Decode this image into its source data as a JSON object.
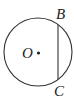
{
  "diagram": {
    "type": "geometry",
    "circle": {
      "cx": 38,
      "cy": 52,
      "r": 34,
      "stroke": "#333333"
    },
    "chord": {
      "x1": 58,
      "y1": 24.5,
      "x2": 58,
      "y2": 79.5,
      "stroke": "#333333"
    },
    "center_point": {
      "cx": 38.5,
      "cy": 53,
      "r": 1.6,
      "fill": "#222222"
    },
    "labels": {
      "center": "O",
      "top_end": "B",
      "bottom_end": "C"
    }
  }
}
